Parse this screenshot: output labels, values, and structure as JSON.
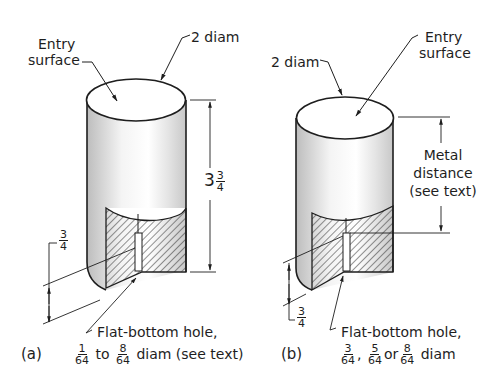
{
  "figure": {
    "panel_a": {
      "label": "(a)",
      "entry_surface": [
        "Entry",
        "surface"
      ],
      "diameter": "2 diam",
      "height_whole": "3",
      "height_frac": {
        "num": "3",
        "den": "4"
      },
      "hole_depth": {
        "num": "3",
        "den": "4"
      },
      "hole_label": "Flat-bottom hole,",
      "hole_size": {
        "frac1": {
          "num": "1",
          "den": "64"
        },
        "to": "to",
        "frac2": {
          "num": "8",
          "den": "64"
        },
        "suffix": "diam (see text)"
      }
    },
    "panel_b": {
      "label": "(b)",
      "entry_surface": [
        "Entry",
        "surface"
      ],
      "diameter": "2 diam",
      "metal_distance": [
        "Metal",
        "distance",
        "(see text)"
      ],
      "hole_depth": {
        "num": "3",
        "den": "4"
      },
      "hole_label": "Flat-bottom hole,",
      "hole_size": {
        "frac1": {
          "num": "3",
          "den": "64"
        },
        "sep1": ",",
        "frac2": {
          "num": "5",
          "den": "64"
        },
        "sep2": "or",
        "frac3": {
          "num": "8",
          "den": "64"
        },
        "suffix": "diam"
      }
    }
  },
  "colors": {
    "line": "#1e1e1e",
    "shade": "#cfcfcf",
    "background": "#ffffff"
  }
}
